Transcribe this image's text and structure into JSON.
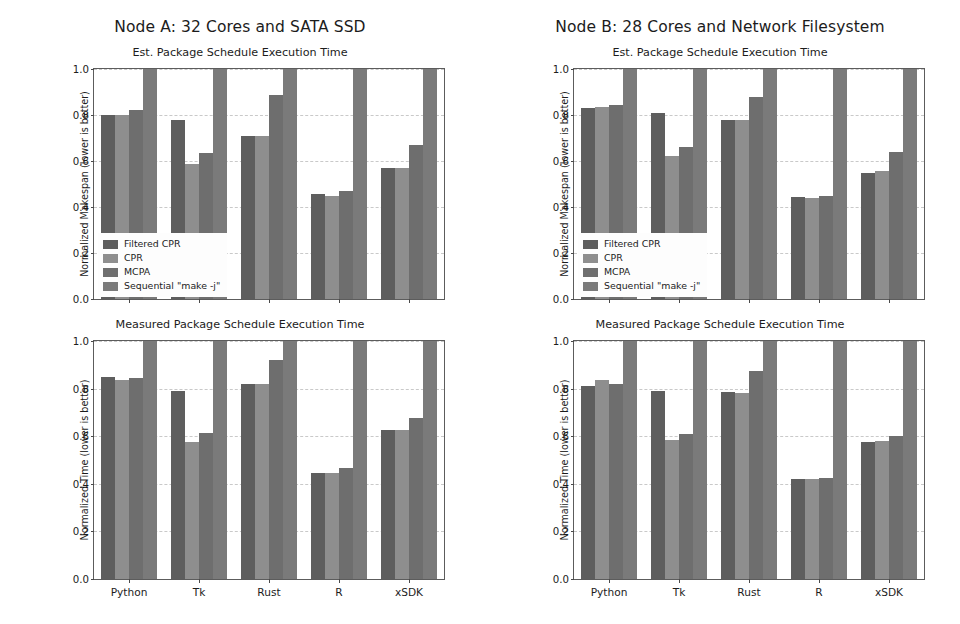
{
  "figure": {
    "background": "#ffffff",
    "nodes": [
      {
        "id": "node-a",
        "title": "Node A: 32 Cores and SATA SSD"
      },
      {
        "id": "node-b",
        "title": "Node B: 28 Cores and Network Filesystem"
      }
    ]
  },
  "series_names": [
    "Filtered CPR",
    "CPR",
    "MCPA",
    "Sequential \"make -j\""
  ],
  "series_colors": [
    "#5e5e5e",
    "#8e8e8e",
    "#6e6e6e",
    "#7a7a7a"
  ],
  "categories": [
    "Python",
    "Tk",
    "Rust",
    "R",
    "xSDK"
  ],
  "yticks": [
    "0.0",
    "0.2",
    "0.4",
    "0.6",
    "0.8",
    "1.0"
  ],
  "ylabel_est": "Normalized Makespan (lower is better)",
  "ylabel_measured": "Normalized Time (lower is better)",
  "panel_title_est": "Est. Package Schedule Execution Time",
  "panel_title_measured": "Measured Package Schedule Execution Time",
  "chart_data": [
    {
      "type": "bar",
      "id": "node-a-est",
      "title": "Est. Package Schedule Execution Time",
      "supertitle": "Node A: 32 Cores and SATA SSD",
      "xlabel": "",
      "ylabel": "Normalized Makespan (lower is better)",
      "ylim": [
        0.0,
        1.0
      ],
      "yticks": [
        0.0,
        0.2,
        0.4,
        0.6,
        0.8,
        1.0
      ],
      "grid": true,
      "legend_position": "lower left",
      "categories": [
        "Python",
        "Tk",
        "Rust",
        "R",
        "xSDK"
      ],
      "series": [
        {
          "name": "Filtered CPR",
          "values": [
            0.8,
            0.78,
            0.71,
            0.455,
            0.57
          ]
        },
        {
          "name": "CPR",
          "values": [
            0.8,
            0.585,
            0.71,
            0.45,
            0.57
          ]
        },
        {
          "name": "MCPA",
          "values": [
            0.82,
            0.635,
            0.885,
            0.47,
            0.67
          ]
        },
        {
          "name": "Sequential \"make -j\"",
          "values": [
            1.0,
            1.0,
            1.0,
            1.0,
            1.0
          ]
        }
      ]
    },
    {
      "type": "bar",
      "id": "node-a-measured",
      "title": "Measured Package Schedule Execution Time",
      "supertitle": "Node A: 32 Cores and SATA SSD",
      "xlabel": "",
      "ylabel": "Normalized Time (lower is better)",
      "ylim": [
        0.0,
        1.0
      ],
      "yticks": [
        0.0,
        0.2,
        0.4,
        0.6,
        0.8,
        1.0
      ],
      "grid": true,
      "legend_position": "none",
      "categories": [
        "Python",
        "Tk",
        "Rust",
        "R",
        "xSDK"
      ],
      "series": [
        {
          "name": "Filtered CPR",
          "values": [
            0.85,
            0.79,
            0.82,
            0.445,
            0.625
          ]
        },
        {
          "name": "CPR",
          "values": [
            0.835,
            0.575,
            0.82,
            0.445,
            0.625
          ]
        },
        {
          "name": "MCPA",
          "values": [
            0.845,
            0.615,
            0.92,
            0.465,
            0.675
          ]
        },
        {
          "name": "Sequential \"make -j\"",
          "values": [
            1.0,
            1.0,
            1.0,
            1.0,
            1.0
          ]
        }
      ]
    },
    {
      "type": "bar",
      "id": "node-b-est",
      "title": "Est. Package Schedule Execution Time",
      "supertitle": "Node B: 28 Cores and Network Filesystem",
      "xlabel": "",
      "ylabel": "Normalized Makespan (lower is better)",
      "ylim": [
        0.0,
        1.0
      ],
      "yticks": [
        0.0,
        0.2,
        0.4,
        0.6,
        0.8,
        1.0
      ],
      "grid": true,
      "legend_position": "lower left",
      "categories": [
        "Python",
        "Tk",
        "Rust",
        "R",
        "xSDK"
      ],
      "series": [
        {
          "name": "Filtered CPR",
          "values": [
            0.83,
            0.81,
            0.78,
            0.445,
            0.55
          ]
        },
        {
          "name": "CPR",
          "values": [
            0.835,
            0.62,
            0.78,
            0.44,
            0.555
          ]
        },
        {
          "name": "MCPA",
          "values": [
            0.845,
            0.66,
            0.88,
            0.45,
            0.64
          ]
        },
        {
          "name": "Sequential \"make -j\"",
          "values": [
            1.0,
            1.0,
            1.0,
            1.0,
            1.0
          ]
        }
      ]
    },
    {
      "type": "bar",
      "id": "node-b-measured",
      "title": "Measured Package Schedule Execution Time",
      "supertitle": "Node B: 28 Cores and Network Filesystem",
      "xlabel": "",
      "ylabel": "Normalized Time (lower is better)",
      "ylim": [
        0.0,
        1.0
      ],
      "yticks": [
        0.0,
        0.2,
        0.4,
        0.6,
        0.8,
        1.0
      ],
      "grid": true,
      "legend_position": "none",
      "categories": [
        "Python",
        "Tk",
        "Rust",
        "R",
        "xSDK"
      ],
      "series": [
        {
          "name": "Filtered CPR",
          "values": [
            0.81,
            0.79,
            0.785,
            0.42,
            0.575
          ]
        },
        {
          "name": "CPR",
          "values": [
            0.835,
            0.585,
            0.78,
            0.42,
            0.58
          ]
        },
        {
          "name": "MCPA",
          "values": [
            0.82,
            0.61,
            0.875,
            0.425,
            0.6
          ]
        },
        {
          "name": "Sequential \"make -j\"",
          "values": [
            1.0,
            1.0,
            1.0,
            1.0,
            1.0
          ]
        }
      ]
    }
  ]
}
